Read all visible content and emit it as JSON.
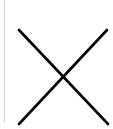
{
  "close_button": {
    "icon": "close-icon",
    "glyph": "✕",
    "stroke_color": "#000000"
  },
  "divider": {
    "color": "#d4d4d4"
  }
}
